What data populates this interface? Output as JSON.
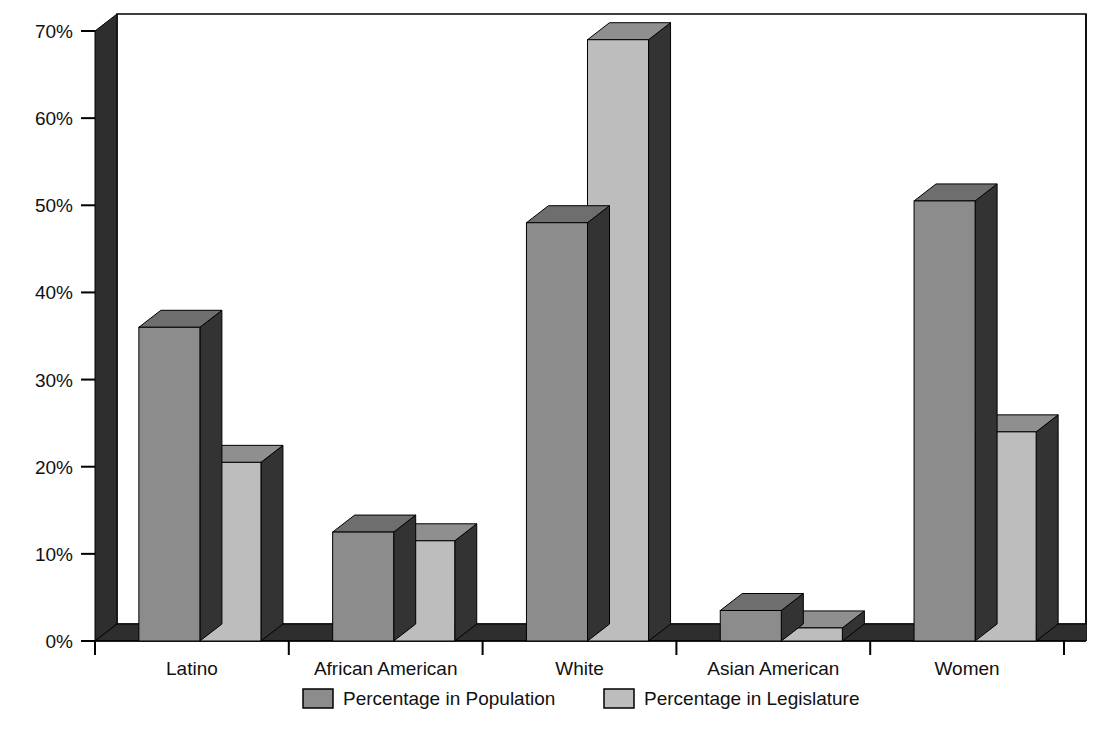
{
  "chart_data": {
    "type": "bar",
    "title": "",
    "subtitle": "",
    "xlabel": "",
    "ylabel": "",
    "categories": [
      "Latino",
      "African American",
      "White",
      "Asian American",
      "Women"
    ],
    "series": [
      {
        "name": "Percentage in Population",
        "values": [
          36,
          12.5,
          48,
          3.5,
          50.5
        ],
        "color": "#8c8c8c"
      },
      {
        "name": "Percentage in Legislature",
        "values": [
          20.5,
          11.5,
          69,
          1.5,
          24
        ],
        "color": "#bdbdbd"
      }
    ],
    "ylim": [
      0,
      70
    ],
    "ytick_values": [
      0,
      10,
      20,
      30,
      40,
      50,
      60,
      70
    ],
    "ytick_labels": [
      "0%",
      "10%",
      "20%",
      "30%",
      "40%",
      "50%",
      "60%",
      "70%"
    ],
    "grid": false,
    "legend_position": "bottom",
    "style": "3d-column",
    "annotations": []
  },
  "axes": {
    "y_axis_name": "y-axis",
    "x_axis_name": "x-axis",
    "tick_suffix": "%"
  },
  "legend": {
    "items": [
      {
        "label": "Percentage in Population",
        "swatch_face": "#8c8c8c"
      },
      {
        "label": "Percentage in Legislature",
        "swatch_face": "#bdbdbd"
      }
    ]
  },
  "colors": {
    "bar_population_face": "#8c8c8c",
    "bar_population_side": "#333333",
    "bar_population_top": "#6e6e6e",
    "bar_legislature_face": "#bdbdbd",
    "bar_legislature_side": "#333333",
    "bar_legislature_top": "#8f8f8f",
    "wall_dark": "#2e2e2e",
    "floor_dark": "#2e2e2e",
    "plot_background": "#ffffff",
    "frame_line": "#000000",
    "text": "#111111"
  }
}
